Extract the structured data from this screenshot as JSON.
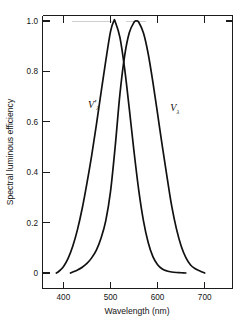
{
  "chart_data": {
    "type": "line",
    "title": "",
    "xlabel": "Wavelength (nm)",
    "ylabel": "Spectral luminous efficiency",
    "xlim": [
      365,
      730
    ],
    "ylim": [
      -0.03,
      1.06
    ],
    "xticks": [
      400,
      500,
      600,
      700
    ],
    "xtick_labels": [
      "400",
      "500",
      "600",
      "700"
    ],
    "yticks": [
      0,
      0.2,
      0.4,
      0.6,
      0.8,
      1.0
    ],
    "ytick_labels": [
      "0",
      "0.2",
      "0.4",
      "0.6",
      "0.8",
      "1.0"
    ],
    "grid": false,
    "legend": "inline-curve-labels",
    "series": [
      {
        "name": "V'λ",
        "label_display": "V",
        "label_prime": "′",
        "label_sub": "λ",
        "description": "scotopic spectral luminous efficiency",
        "peak_wavelength_nm": 507,
        "peak_value": 1.0,
        "label_position": {
          "x_nm": 452,
          "y": 0.655
        },
        "x": [
          385,
          390,
          400,
          410,
          420,
          430,
          440,
          450,
          460,
          470,
          480,
          490,
          500,
          507,
          510,
          520,
          530,
          540,
          550,
          560,
          570,
          580,
          590,
          600,
          610,
          620,
          630,
          640,
          650,
          660
        ],
        "y": [
          0.0,
          0.006,
          0.025,
          0.058,
          0.107,
          0.173,
          0.257,
          0.357,
          0.466,
          0.588,
          0.717,
          0.843,
          0.958,
          1.0,
          0.997,
          0.935,
          0.811,
          0.65,
          0.481,
          0.328,
          0.207,
          0.121,
          0.065,
          0.033,
          0.016,
          0.008,
          0.004,
          0.002,
          0.001,
          0.0
        ]
      },
      {
        "name": "Vλ",
        "label_display": "V",
        "label_prime": "",
        "label_sub": "λ",
        "description": "photopic spectral luminous efficiency",
        "peak_wavelength_nm": 555,
        "peak_value": 1.0,
        "label_position": {
          "x_nm": 627,
          "y": 0.645
        },
        "x": [
          415,
          420,
          430,
          440,
          450,
          460,
          470,
          480,
          490,
          500,
          510,
          520,
          530,
          540,
          550,
          555,
          560,
          570,
          580,
          590,
          600,
          610,
          620,
          630,
          640,
          650,
          660,
          670,
          680,
          690,
          700
        ],
        "y": [
          0.0,
          0.004,
          0.012,
          0.023,
          0.038,
          0.06,
          0.091,
          0.139,
          0.208,
          0.323,
          0.503,
          0.71,
          0.862,
          0.954,
          0.995,
          1.0,
          0.995,
          0.952,
          0.87,
          0.757,
          0.631,
          0.503,
          0.381,
          0.265,
          0.175,
          0.107,
          0.061,
          0.032,
          0.017,
          0.008,
          0.0
        ]
      }
    ]
  },
  "axes": {
    "x_title": "Wavelength (nm)",
    "y_title": "Spectral luminous efficiency"
  }
}
